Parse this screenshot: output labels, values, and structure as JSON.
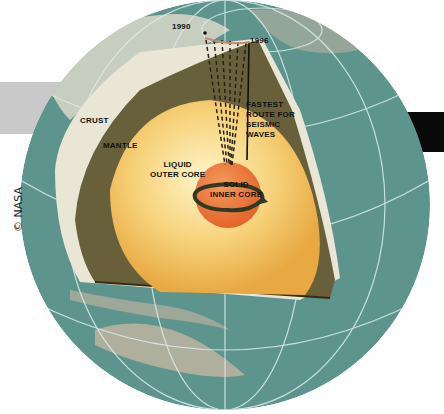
{
  "diagram": {
    "year_markers": [
      "1990",
      "1996"
    ],
    "layers": {
      "crust": "CRUST",
      "mantle": "MANTLE",
      "outer_core": "LIQUID\nOUTER CORE",
      "inner_core": "SOLID\nINNER CORE"
    },
    "annotation": "FASTEST\nROUTE FOR\nSEISMIC\nWAVES",
    "credit": "© NASA"
  },
  "colors": {
    "ocean": "#5f958f",
    "land": "#b9b1a0",
    "crust": "#e9e6d6",
    "mantle": "#67603a",
    "outer_core": "#f2c667",
    "inner_core": "#ee7a3a",
    "gridline": "#d9ecea"
  }
}
